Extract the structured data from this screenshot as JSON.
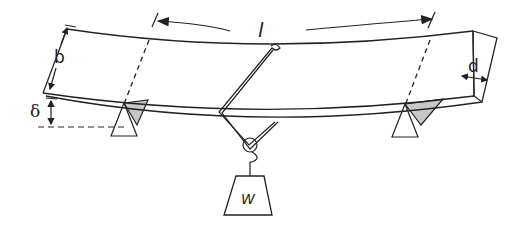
{
  "figure": {
    "colors": {
      "stroke": "#222222",
      "support_shade": "#c8c8c8",
      "background": "#ffffff"
    }
  },
  "labels": {
    "span": "l",
    "height": "b",
    "width": "d",
    "deflection": "δ",
    "weight": "W"
  },
  "components": [
    {
      "name": "beam",
      "description": "Curved rectangular beam (deflected)"
    },
    {
      "name": "left-support",
      "description": "Triangular knife-edge support"
    },
    {
      "name": "right-support",
      "description": "Triangular knife-edge support"
    },
    {
      "name": "hanger",
      "description": "Wire stirrup over beam at midspan"
    },
    {
      "name": "weight",
      "description": "Trapezoidal hanging mass W"
    }
  ]
}
